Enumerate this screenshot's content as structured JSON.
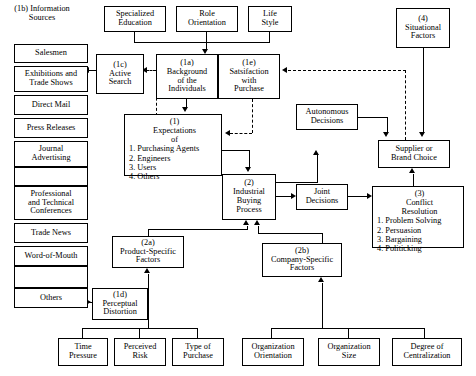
{
  "diagram": {
    "sidebar_header": {
      "code": "(1b)",
      "line1": "Information",
      "line2": "Sources"
    },
    "sidebar_items": [
      {
        "label": "Salesmen"
      },
      {
        "label": "Exhibitions and",
        "label2": "Trade Shows"
      },
      {
        "label": "Direct Mail"
      },
      {
        "label": "Press Releases"
      },
      {
        "label": "Journal",
        "label2": "Advertising"
      },
      {
        "label": "Professional",
        "label2": "and Technical",
        "label3": "Conferences"
      },
      {
        "label": "Trade News"
      },
      {
        "label": "Word-of-Mouth"
      },
      {
        "label": "Others"
      }
    ],
    "nodes": {
      "specialized_education": {
        "line1": "Specialized",
        "line2": "Education"
      },
      "role_orientation": {
        "line1": "Role",
        "line2": "Orientation"
      },
      "life_style": {
        "line1": "Life",
        "line2": "Style"
      },
      "active_search": {
        "code": "(1c)",
        "line1": "Active",
        "line2": "Search"
      },
      "background": {
        "code": "(1a)",
        "line1": "Background",
        "line2": "of the",
        "line3": "Individuals"
      },
      "satisfaction": {
        "code": "(1e)",
        "line1": "Satsifaction",
        "line2": "with",
        "line3": "Purchase"
      },
      "expectations": {
        "code": "(1)",
        "line1": "Expectations",
        "line2": "of",
        "items": [
          "1. Purchasing Agents",
          "2. Engineers",
          "3. Users",
          "4. Others"
        ]
      },
      "industrial_buying": {
        "code": "(2)",
        "line1": "Industrial",
        "line2": "Buying",
        "line3": "Process"
      },
      "autonomous": {
        "line1": "Autonomous",
        "line2": "Decisions"
      },
      "joint": {
        "line1": "Joint",
        "line2": "Decisions"
      },
      "situational": {
        "code": "(4)",
        "line1": "Situational",
        "line2": "Factors"
      },
      "supplier": {
        "line1": "Supplier or",
        "line2": "Brand Choice"
      },
      "conflict": {
        "code": "(3)",
        "line1": "Conflict",
        "line2": "Resolution",
        "items": [
          "1. Problem Solving",
          "2. Persuasion",
          "3. Bargaining",
          "4. Politicking"
        ]
      },
      "product_specific": {
        "code": "(2a)",
        "line1": "Product-Specific",
        "line2": "Factors"
      },
      "company_specific": {
        "code": "(2b)",
        "line1": "Company-Specific",
        "line2": "Factors"
      },
      "perceptual": {
        "code": "(1d)",
        "line1": "Perceptual",
        "line2": "Distortion"
      },
      "time_pressure": {
        "line1": "Time",
        "line2": "Pressure"
      },
      "perceived_risk": {
        "line1": "Perceived",
        "line2": "Risk"
      },
      "type_of_purchase": {
        "line1": "Type of",
        "line2": "Purchase"
      },
      "org_orientation": {
        "line1": "Organization",
        "line2": "Orientation"
      },
      "org_size": {
        "line1": "Organization",
        "line2": "Size"
      },
      "degree_central": {
        "line1": "Degree of",
        "line2": "Centralization"
      }
    },
    "colors": {
      "stroke": "#000000",
      "background": "#ffffff"
    }
  }
}
